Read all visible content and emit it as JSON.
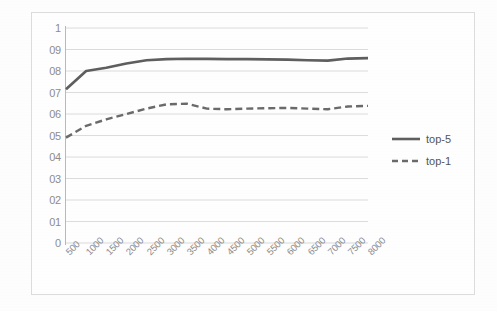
{
  "chart_data": {
    "type": "line",
    "title": "",
    "xlabel": "",
    "ylabel": "",
    "ylim": [
      0,
      1
    ],
    "ytick_step": 0.1,
    "grid": true,
    "legend_position": "right",
    "categories": [
      "500",
      "1000",
      "1500",
      "2000",
      "2500",
      "3000",
      "3500",
      "4000",
      "4500",
      "5000",
      "5500",
      "6000",
      "6500",
      "7000",
      "7500",
      "8000"
    ],
    "ytick_labels": [
      "1",
      "09",
      "08",
      "07",
      "06",
      "05",
      "04",
      "03",
      "02",
      "01",
      "0"
    ],
    "ytick_values": [
      1,
      0.9,
      0.8,
      0.7,
      0.6,
      0.5,
      0.4,
      0.3,
      0.2,
      0.1,
      0
    ],
    "series": [
      {
        "name": "top-5",
        "style": "solid",
        "color": "#5e5e5e",
        "values": [
          0.715,
          0.8,
          0.815,
          0.835,
          0.85,
          0.855,
          0.857,
          0.856,
          0.855,
          0.855,
          0.854,
          0.853,
          0.85,
          0.848,
          0.858,
          0.86
        ]
      },
      {
        "name": "top-1",
        "style": "dashed",
        "color": "#6a6a6a",
        "values": [
          0.49,
          0.545,
          0.575,
          0.6,
          0.625,
          0.645,
          0.648,
          0.625,
          0.622,
          0.625,
          0.627,
          0.628,
          0.625,
          0.622,
          0.635,
          0.638
        ]
      }
    ]
  },
  "legend": {
    "items": [
      {
        "label": "top-5",
        "style": "solid"
      },
      {
        "label": "top-1",
        "style": "dashed"
      }
    ]
  },
  "colors": {
    "series_gray": "#5e5e5e",
    "grid": "#d8d8d8",
    "axis": "#b9b9b9",
    "tick_text": "#8d8d8d",
    "frame": "#dcdcdc",
    "background": "#fefefe"
  }
}
